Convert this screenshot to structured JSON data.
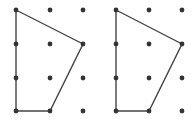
{
  "diagram": {
    "type": "dot-grid-polygons",
    "colors": {
      "dot": "#333333",
      "line": "#444444",
      "background": "#ffffff"
    },
    "panels": [
      {
        "name": "left",
        "grid": {
          "cols": 3,
          "rows": 4,
          "xs": [
            16,
            50,
            83
          ],
          "ys": [
            10,
            44,
            78,
            111
          ]
        },
        "polygon": [
          [
            0,
            0
          ],
          [
            2,
            1
          ],
          [
            1,
            3
          ],
          [
            0,
            3
          ]
        ]
      },
      {
        "name": "right",
        "grid": {
          "cols": 3,
          "rows": 4,
          "xs": [
            116,
            149,
            182
          ],
          "ys": [
            10,
            44,
            78,
            111
          ]
        },
        "polygon": [
          [
            0,
            0
          ],
          [
            2,
            1
          ],
          [
            1,
            3
          ],
          [
            0,
            3
          ]
        ]
      }
    ]
  }
}
